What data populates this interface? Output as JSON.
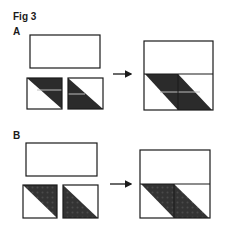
{
  "figure": {
    "title": "Fig 3",
    "panels": [
      {
        "label": "A",
        "fill": "dark solid with light stripe",
        "fill_color": "#2b2b2b",
        "stripe_color": "#bdbdbd"
      },
      {
        "label": "B",
        "fill": "dark dotted texture",
        "fill_color": "#333333",
        "dot_color": "#4a4a4a"
      }
    ],
    "colors": {
      "line": "#1a1a1a",
      "background": "#ffffff"
    }
  }
}
